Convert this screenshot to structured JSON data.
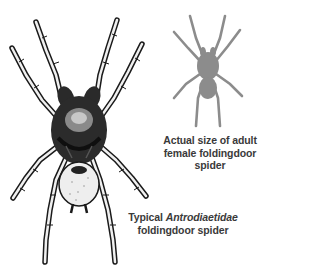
{
  "illustration": {
    "main_subject": "spider-drawing",
    "size_reference": "spider-silhouette"
  },
  "captions": {
    "size_reference": {
      "line1": "Actual size of adult",
      "line2": "female foldingdoor",
      "line3": "spider"
    },
    "typical": {
      "prefix": "Typical ",
      "family": "Antrodiaetidae",
      "line2": "foldingdoor spider"
    }
  },
  "colors": {
    "ink": "#1a1a1a",
    "silhouette": "#8c8c8c",
    "caption": "#3a3a3a",
    "background": "#ffffff"
  }
}
